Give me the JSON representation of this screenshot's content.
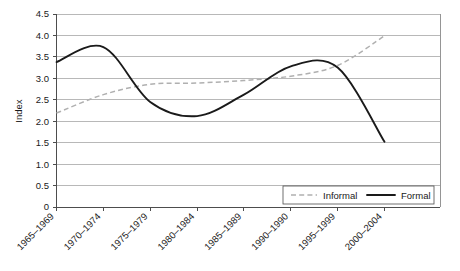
{
  "chart_data": {
    "type": "line",
    "title": "",
    "xlabel": "",
    "ylabel": "Index",
    "ylim": [
      0,
      4.5
    ],
    "ytick_labels": [
      "0",
      "0.5",
      "1.0",
      "1.5",
      "2.0",
      "2.5",
      "3.0",
      "3.5",
      "4.0",
      "4.5"
    ],
    "ytick_values": [
      0,
      0.5,
      1.0,
      1.5,
      2.0,
      2.5,
      3.0,
      3.5,
      4.0,
      4.5
    ],
    "grid": true,
    "legend_position": "bottom-right",
    "categories": [
      "1965–1969",
      "1970–1974",
      "1975–1979",
      "1980–1984",
      "1985–1989",
      "1990–1990",
      "1995–1999",
      "2000–2004"
    ],
    "series": [
      {
        "name": "Informal",
        "style": "dashed",
        "color": "#b0b0b0",
        "values": [
          2.19,
          2.62,
          2.86,
          2.89,
          2.95,
          3.05,
          3.3,
          3.99
        ]
      },
      {
        "name": "Formal",
        "style": "solid",
        "color": "#1a1a1a",
        "values": [
          3.38,
          3.73,
          2.45,
          2.12,
          2.62,
          3.28,
          3.25,
          1.52
        ]
      }
    ]
  },
  "legend": {
    "entries": [
      {
        "label": "Informal",
        "style": "dashed"
      },
      {
        "label": "Formal",
        "style": "solid"
      }
    ]
  },
  "axes": {
    "y_title": "Index"
  }
}
